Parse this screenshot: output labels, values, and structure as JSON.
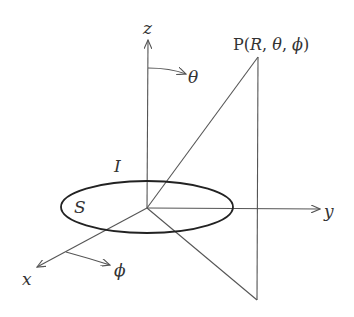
{
  "diagram": {
    "labels": {
      "z_axis": "z",
      "y_axis": "y",
      "x_axis": "x",
      "theta": "θ",
      "phi": "ϕ",
      "current": "I",
      "surface": "S",
      "point_prefix": "P(",
      "point_R": "R",
      "point_sep1": ", ",
      "point_theta": "θ",
      "point_sep2": ", ",
      "point_phi": "ϕ",
      "point_suffix": ")"
    },
    "colors": {
      "line": "#555555",
      "loop": "#222222",
      "text": "#333333"
    }
  }
}
